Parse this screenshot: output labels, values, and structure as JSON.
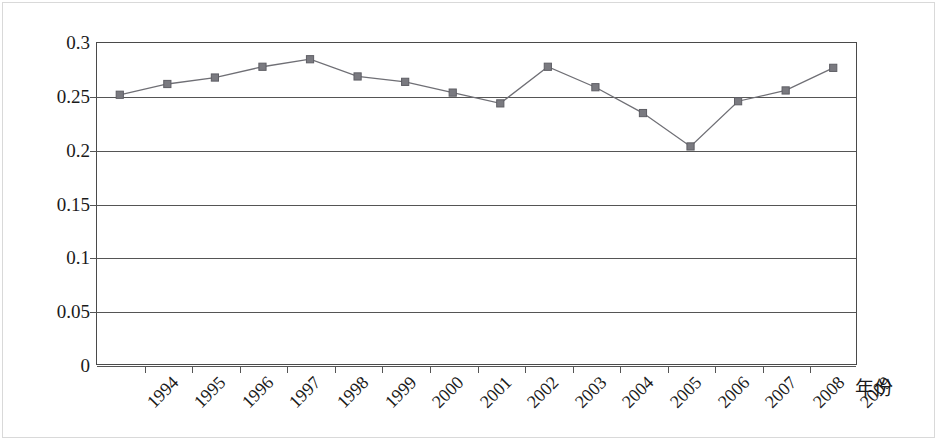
{
  "chart_data": {
    "type": "line",
    "title": "",
    "subtitle": "",
    "xlabel": "年份",
    "ylabel": "",
    "categories": [
      "1994",
      "1995",
      "1996",
      "1997",
      "1998",
      "1999",
      "2000",
      "2001",
      "2002",
      "2003",
      "2004",
      "2005",
      "2006",
      "2007",
      "2008",
      "2009"
    ],
    "series": [
      {
        "name": "",
        "values": [
          0.251,
          0.261,
          0.267,
          0.277,
          0.284,
          0.268,
          0.263,
          0.253,
          0.243,
          0.277,
          0.258,
          0.234,
          0.203,
          0.245,
          0.255,
          0.276
        ]
      }
    ],
    "ylim": [
      0,
      0.3
    ],
    "ytick_labels": [
      "0.3",
      "0.25",
      "0.2",
      "0.15",
      "0.1",
      "0.05",
      "0"
    ],
    "ytick_values": [
      0.3,
      0.25,
      0.2,
      0.15,
      0.1,
      0.05,
      0
    ],
    "grid": "horizontal",
    "legend": "none",
    "marker": "square",
    "line_color": "#6f6f75",
    "marker_color": "#7a7a80",
    "axis_color": "#4a4a4a",
    "annotations": []
  }
}
